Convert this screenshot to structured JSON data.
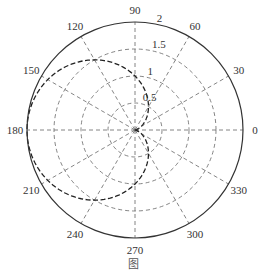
{
  "chart_data": {
    "type": "line",
    "subtype": "polar",
    "title": "",
    "caption": "图",
    "series": [
      {
        "name": "r = 1 - cos(theta)",
        "style": "dashed",
        "color": "#222222",
        "theta_deg": [
          0,
          30,
          60,
          90,
          120,
          150,
          180,
          210,
          240,
          270,
          300,
          330,
          360
        ],
        "r": [
          0,
          0.134,
          0.5,
          1,
          1.5,
          1.866,
          2,
          1.866,
          1.5,
          1,
          0.5,
          0.134,
          0
        ]
      }
    ],
    "angular_ticks": [
      "0",
      "30",
      "60",
      "90",
      "120",
      "150",
      "180",
      "210",
      "240",
      "270",
      "300",
      "330"
    ],
    "radial_ticks": [
      "0.5",
      "1",
      "1.5",
      "2"
    ],
    "rlim": [
      0,
      2
    ],
    "grid": true,
    "grid_style": "dashed"
  },
  "geometry": {
    "cx": 135,
    "cy": 130,
    "rmax_px": 108
  },
  "colors": {
    "axis": "#333333",
    "grid": "#666666",
    "curve": "#222222"
  }
}
